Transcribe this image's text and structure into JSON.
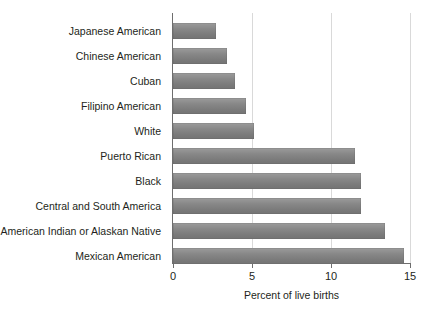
{
  "chart_data": {
    "type": "bar",
    "orientation": "horizontal",
    "title": "",
    "xlabel": "Percent of live births",
    "ylabel": "",
    "xlim": [
      0,
      15
    ],
    "xticks": [
      0,
      5,
      10,
      15
    ],
    "xtick_labels": [
      "0",
      "5",
      "10",
      "15"
    ],
    "grid": "vertical",
    "legend": "none",
    "bar_color": "#808080",
    "axis_color": "#6e6e6e",
    "gridline_color": "#d9d9d9",
    "background_color": "#ffffff",
    "categories": [
      "Japanese American",
      "Chinese American",
      "Cuban",
      "Filipino American",
      "White",
      "Puerto Rican",
      "Black",
      "Central and South America",
      "American Indian or Alaskan Native",
      "Mexican American"
    ],
    "values": [
      2.7,
      3.4,
      3.9,
      4.6,
      5.1,
      11.5,
      11.9,
      11.9,
      13.4,
      14.6
    ]
  }
}
